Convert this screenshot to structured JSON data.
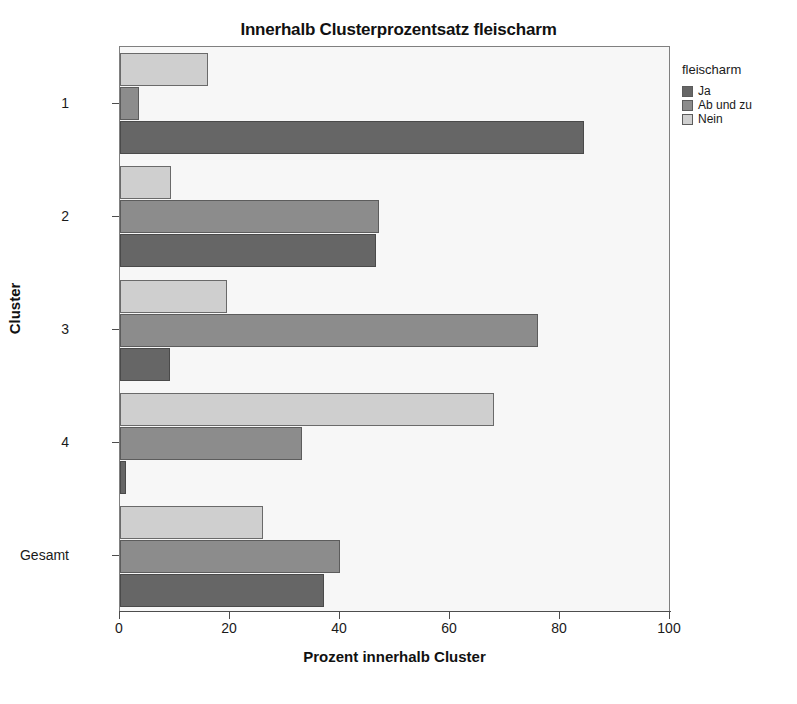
{
  "chart_data": {
    "type": "bar",
    "orientation": "horizontal",
    "title": "Innerhalb Clusterprozentsatz fleischarm",
    "xlabel": "Prozent innerhalb Cluster",
    "ylabel": "Cluster",
    "xlim": [
      0,
      100
    ],
    "xticks": [
      0,
      20,
      40,
      60,
      80,
      100
    ],
    "xtick_labels": [
      "0",
      "20",
      "40",
      "60",
      "80",
      "100"
    ],
    "grid": false,
    "legend_position": "right",
    "legend_title": "fleischarm",
    "categories": [
      "1",
      "2",
      "3",
      "4",
      "Gesamt"
    ],
    "series": [
      {
        "name": "Ja",
        "color": "#666666",
        "values": [
          84.4,
          46.5,
          9.0,
          1.0,
          37.0
        ]
      },
      {
        "name": "Ab und zu",
        "color": "#8c8c8c",
        "values": [
          3.5,
          47.0,
          76.0,
          33.0,
          40.0
        ]
      },
      {
        "name": "Nein",
        "color": "#cfcfcf",
        "values": [
          16.0,
          9.3,
          19.4,
          68.0,
          26.0
        ]
      }
    ]
  },
  "legend": {
    "title": "fleischarm",
    "items": [
      {
        "label": "Ja",
        "color": "#666666"
      },
      {
        "label": "Ab und zu",
        "color": "#8c8c8c"
      },
      {
        "label": "Nein",
        "color": "#cfcfcf"
      }
    ]
  },
  "axes": {
    "x_title": "Prozent innerhalb Cluster",
    "y_title": "Cluster",
    "x_tick_labels": [
      "0",
      "20",
      "40",
      "60",
      "80",
      "100"
    ],
    "y_tick_labels": [
      "1",
      "2",
      "3",
      "4",
      "Gesamt"
    ]
  }
}
